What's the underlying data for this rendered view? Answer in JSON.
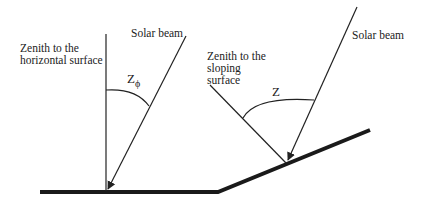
{
  "figure": {
    "left_panel": {
      "zenith_label_line1": "Zenith to the",
      "zenith_label_line2": "horizontal surface",
      "beam_label": "Solar beam",
      "angle_symbol": "Z",
      "angle_subscript": "ϕ"
    },
    "right_panel": {
      "zenith_label_line1": "Zenith to the",
      "zenith_label_line2": "sloping",
      "zenith_label_line3": "surface",
      "beam_label": "Solar beam",
      "angle_symbol": "Z"
    },
    "colors": {
      "line": "#222222",
      "ground": "#1a1a1a",
      "background": "#ffffff"
    }
  }
}
